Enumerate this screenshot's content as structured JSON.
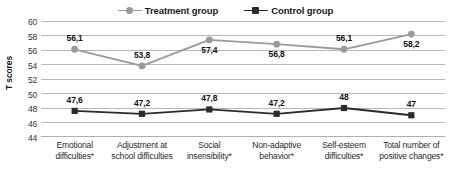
{
  "chart_data": {
    "type": "line",
    "title": "",
    "xlabel": "",
    "ylabel": "T scores",
    "ylim": [
      44,
      60
    ],
    "yticks": [
      "44",
      "46",
      "48",
      "50",
      "52",
      "54",
      "56",
      "58",
      "60"
    ],
    "grid": true,
    "legend_position": "top",
    "categories": [
      "Emotional difficulties*",
      "Adjustment at school difficulties",
      "Social insensibility*",
      "Non-adaptive behavior*",
      "Self-esteem difficulties*",
      "Total number of positive changes*"
    ],
    "series": [
      {
        "name": "Treatment group",
        "color": "#9a9a9a",
        "marker": "circle",
        "values": [
          56.1,
          53.8,
          57.4,
          56.8,
          56.1,
          58.2
        ],
        "labels": [
          "56,1",
          "53,8",
          "57,4",
          "56,8",
          "56,1",
          "58,2"
        ],
        "label_positions": [
          "above",
          "above",
          "below",
          "below",
          "above",
          "below"
        ]
      },
      {
        "name": "Control group",
        "color": "#2b2b2b",
        "marker": "square",
        "values": [
          47.6,
          47.2,
          47.8,
          47.2,
          48.0,
          47.0
        ],
        "labels": [
          "47,6",
          "47,2",
          "47,8",
          "47,2",
          "48",
          "47"
        ],
        "label_positions": [
          "above",
          "above",
          "above",
          "above",
          "above",
          "above"
        ]
      }
    ]
  },
  "legend": {
    "treatment_label": "Treatment group",
    "control_label": "Control group"
  },
  "axis": {
    "y_title": "T scores",
    "ticks": {
      "t0": "44",
      "t1": "46",
      "t2": "48",
      "t3": "50",
      "t4": "52",
      "t5": "54",
      "t6": "56",
      "t7": "58",
      "t8": "60"
    }
  },
  "categories": {
    "c0": "Emotional difficulties*",
    "c1": "Adjustment at school difficulties",
    "c2": "Social insensibility*",
    "c3": "Non-adaptive behavior*",
    "c4": "Self-esteem difficulties*",
    "c5": "Total number of positive changes*"
  },
  "labels": {
    "t0": "56,1",
    "t1": "53,8",
    "t2": "57,4",
    "t3": "56,8",
    "t4": "56,1",
    "t5": "58,2",
    "c0": "47,6",
    "c1": "47,2",
    "c2": "47,8",
    "c3": "47,2",
    "c4": "48",
    "c5": "47"
  },
  "colors": {
    "treatment": "#9a9a9a",
    "control": "#2b2b2b",
    "gridline": "#b0b0b0"
  }
}
